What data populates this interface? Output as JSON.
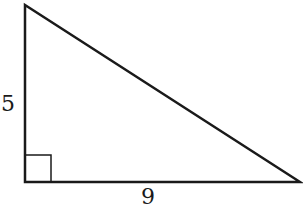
{
  "diagram": {
    "type": "right-triangle",
    "stroke_color": "#1a1a1a",
    "background": "#ffffff",
    "vertices": {
      "top": [
        25,
        5
      ],
      "right_angle": [
        25,
        182
      ],
      "right": [
        300,
        182
      ]
    },
    "right_angle_marker": {
      "x": 25,
      "y": 155,
      "size": 26
    },
    "labels": {
      "vertical_leg": "5",
      "horizontal_leg": "9"
    }
  }
}
